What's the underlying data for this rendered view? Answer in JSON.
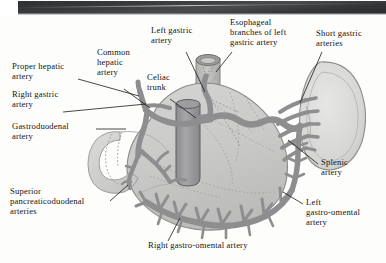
{
  "figure": {
    "type": "anatomical-illustration",
    "canvas": {
      "width": 386,
      "height": 263
    },
    "background_color": "#fdfdfb",
    "scan_edge_color": "#343537"
  },
  "palette": {
    "artery": "#8e8e90",
    "artery_dark": "#6f6f72",
    "artery_outline": "#5d5d60",
    "stomach_fill": "#c9c9c7",
    "stomach_outline": "#8a8a88",
    "spleen_fill": "#d8d8d6",
    "duodenum_fill": "#d2d2d0",
    "esophagus_fill": "#bdbdbb",
    "aorta_fill": "#9a9a9c",
    "label_text": "#141414",
    "leader_line": "#1a1a1a"
  },
  "labels": [
    {
      "id": "proper-hepatic-artery",
      "text": "Proper hepatic\nartery",
      "x": 12,
      "y": 66,
      "align": "left",
      "leader": {
        "from": [
          78,
          79
        ],
        "to": [
          139,
          96
        ]
      }
    },
    {
      "id": "right-gastric-artery",
      "text": "Right gastric\nartery",
      "x": 12,
      "y": 93,
      "align": "left",
      "leader": {
        "from": [
          63,
          112
        ],
        "to": [
          146,
          104
        ]
      }
    },
    {
      "id": "gastroduodenal-artery",
      "text": "Gastroduodenal\nartery",
      "x": 12,
      "y": 124,
      "align": "left",
      "leader": {
        "from": [
          96,
          129
        ],
        "to": [
          126,
          129
        ]
      }
    },
    {
      "id": "superior-pancreaticoduodenal-arteries",
      "text": "Superior\npancreaticoduodenal\narteries",
      "x": 10,
      "y": 190,
      "align": "left",
      "leader": {
        "from": [
          110,
          201
        ],
        "to": [
          128,
          185
        ]
      }
    },
    {
      "id": "common-hepatic-artery",
      "text": "Common\nhepatic\nartery",
      "x": 97,
      "y": 55,
      "align": "left",
      "leader": {
        "from": [
          124,
          89
        ],
        "to": [
          150,
          108
        ]
      }
    },
    {
      "id": "left-gastric-artery",
      "text": "Left gastric\nartery",
      "x": 151,
      "y": 31,
      "align": "left",
      "leader": {
        "from": [
          186,
          52
        ],
        "to": [
          205,
          92
        ]
      }
    },
    {
      "id": "celiac-trunk",
      "text": "Celiac\ntrunk",
      "x": 147,
      "y": 79,
      "align": "left",
      "leader": {
        "from": [
          170,
          99
        ],
        "to": [
          196,
          118
        ]
      }
    },
    {
      "id": "esophageal-branches-of-left-gastric-artery",
      "text": "Esophageal\nbranches of left\ngastric artery",
      "x": 230,
      "y": 20,
      "align": "left",
      "leader": {
        "from": [
          232,
          52
        ],
        "to": [
          216,
          72
        ]
      }
    },
    {
      "id": "short-gastric-arteries",
      "text": "Short gastric\narteries",
      "x": 316,
      "y": 31,
      "align": "left",
      "leader": {
        "from": [
          322,
          52
        ],
        "to": [
          300,
          103
        ]
      }
    },
    {
      "id": "splenic-artery",
      "text": "Splenic\nartery",
      "x": 321,
      "y": 160,
      "align": "left",
      "leader": {
        "from": [
          318,
          164
        ],
        "to": [
          288,
          140
        ]
      }
    },
    {
      "id": "left-gastro-omental-artery",
      "text": "Left\ngastro-omental\nartery",
      "x": 306,
      "y": 200,
      "align": "left",
      "leader": {
        "from": [
          303,
          204
        ],
        "to": [
          283,
          192
        ]
      }
    },
    {
      "id": "right-gastro-omental-artery",
      "text": "Right gastro-omental artery",
      "x": 148,
      "y": 243,
      "align": "left",
      "leader": {
        "from": [
          168,
          241
        ],
        "to": [
          180,
          218
        ]
      }
    }
  ],
  "structures": [
    {
      "id": "stomach",
      "name": "stomach"
    },
    {
      "id": "spleen",
      "name": "spleen"
    },
    {
      "id": "esophagus",
      "name": "esophagus"
    },
    {
      "id": "duodenum",
      "name": "duodenum"
    },
    {
      "id": "aorta",
      "name": "abdominal-aorta"
    },
    {
      "id": "celiac-trunk-vessel",
      "name": "celiac-trunk"
    },
    {
      "id": "gastro-omental-arcade",
      "name": "gastro-omental-arcade"
    }
  ]
}
